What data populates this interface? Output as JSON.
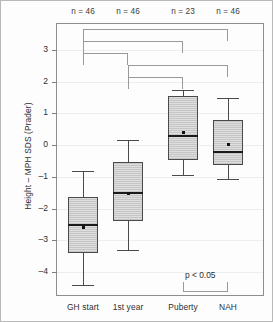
{
  "chart_data": {
    "type": "box",
    "title": "",
    "xlabel": "",
    "ylabel": "Height – MPH SDS (Prader)",
    "ylim": [
      -4.75,
      3.85
    ],
    "yticks": [
      3,
      2,
      1,
      0,
      -1,
      -2,
      -3,
      -4
    ],
    "ytick_labels": [
      "3",
      "2",
      "1",
      "0",
      "–1",
      "–2",
      "–3",
      "–4"
    ],
    "grid": true,
    "legend": "none",
    "categories": [
      "GH start",
      "1st year",
      "Puberty",
      "NAH"
    ],
    "group_counts": [
      "n = 46",
      "n = 46",
      "n = 23",
      "n = 46"
    ],
    "boxes": [
      {
        "name": "GH start",
        "n": 46,
        "whisker_low": -4.4,
        "q1": -3.38,
        "median": -2.52,
        "q3": -1.64,
        "whisker_high": -0.8,
        "mean": -2.57
      },
      {
        "name": "1st year",
        "n": 46,
        "whisker_low": -3.3,
        "q1": -2.38,
        "median": -1.5,
        "q3": -0.53,
        "whisker_high": 0.18,
        "mean": -1.5
      },
      {
        "name": "Puberty",
        "n": 23,
        "whisker_low": -0.93,
        "q1": -0.47,
        "median": 0.3,
        "q3": 1.55,
        "whisker_high": 1.75,
        "mean": 0.42
      },
      {
        "name": "NAH",
        "n": 46,
        "whisker_low": -1.05,
        "q1": -0.62,
        "median": -0.2,
        "q3": 0.8,
        "whisker_high": 1.48,
        "mean": 0.05
      }
    ],
    "significance_brackets": [
      {
        "from": "GH start",
        "to": "NAH",
        "level": 1
      },
      {
        "from": "GH start",
        "to": "Puberty",
        "level": 2
      },
      {
        "from": "GH start",
        "to": "1st year",
        "level": 3
      },
      {
        "from": "1st year",
        "to": "NAH",
        "level": 4
      },
      {
        "from": "1st year",
        "to": "Puberty",
        "level": 5
      }
    ],
    "pvalue_annotation": {
      "label": "p < 0.05",
      "from": "Puberty",
      "to": "NAH"
    },
    "colors": {
      "box_fill": "#dedede",
      "box_edge": "#4a4a4a",
      "median": "#1a1a1a",
      "bracket": "#9a9a9a",
      "grid": "#eeeeee",
      "axis": "#8d8d8d",
      "text": "#2f2f2f"
    }
  }
}
